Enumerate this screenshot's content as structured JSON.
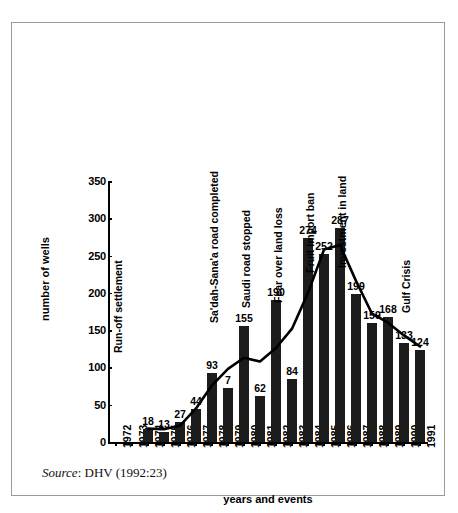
{
  "figure": {
    "source_prefix": "Source",
    "source_text": ": DHV (1992:23)"
  },
  "chart_data": {
    "type": "bar",
    "title": "",
    "xlabel": "years and events",
    "ylabel": "number of wells",
    "ylim": [
      0,
      350
    ],
    "yticks": [
      0,
      50,
      100,
      150,
      200,
      250,
      300,
      350
    ],
    "grid": false,
    "legend": "none",
    "categories": [
      "1972",
      "1973",
      "1974",
      "1975",
      "1976",
      "1977",
      "1978",
      "1979",
      "1980",
      "1981",
      "1982",
      "1983",
      "1984",
      "1985",
      "1986",
      "1987",
      "1988",
      "1989",
      "1990",
      "1991"
    ],
    "values": [
      0,
      0,
      18,
      13,
      27,
      44,
      93,
      72,
      155,
      62,
      190,
      84,
      274,
      252,
      287,
      199,
      159,
      168,
      133,
      124
    ],
    "value_labels": [
      "",
      "",
      "18",
      "13",
      "27",
      "44",
      "93",
      "7",
      "155",
      "62",
      "190",
      "84",
      "274",
      "252",
      "287",
      "199",
      "159",
      "168",
      "133",
      "124"
    ],
    "series": [
      {
        "name": "bars",
        "type": "bar",
        "values": [
          0,
          0,
          18,
          13,
          27,
          44,
          93,
          72,
          155,
          62,
          190,
          84,
          274,
          252,
          287,
          199,
          159,
          168,
          133,
          124
        ]
      },
      {
        "name": "trend",
        "type": "line",
        "values": [
          null,
          null,
          18,
          17,
          22,
          45,
          76,
          98,
          113,
          108,
          126,
          152,
          200,
          258,
          264,
          216,
          172,
          160,
          143,
          128
        ]
      }
    ],
    "annotations": [
      {
        "year": "1972",
        "label": "Run-off settlement"
      },
      {
        "year": "1978",
        "label": "Sa'dah-Sana'a road completed"
      },
      {
        "year": "1980",
        "label": "Saudi road stopped"
      },
      {
        "year": "1982",
        "label": "Fear over land loss"
      },
      {
        "year": "1984",
        "label": "Fruit import ban"
      },
      {
        "year": "1986",
        "label": "Investment in land"
      },
      {
        "year": "1990",
        "label": "Gulf Crisis"
      }
    ],
    "colors": {
      "bar": "#1c1c1c",
      "line": "#000000",
      "axis": "#000000",
      "background": "#ffffff",
      "border": "#9a9a9a"
    }
  }
}
